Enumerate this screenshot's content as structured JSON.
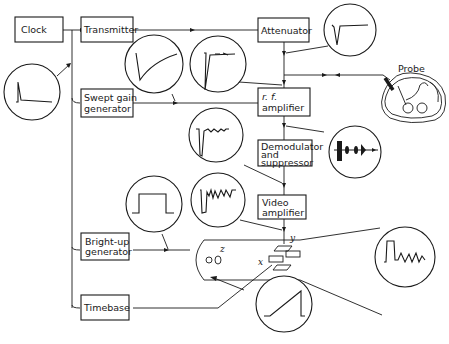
{
  "diagram": {
    "blocks": {
      "clock": "Clock",
      "transmitter": "Transmitter",
      "attenuator": "Attenuator",
      "swept_gain_1": "Swept gain",
      "swept_gain_2": "generator",
      "rf_amp_1": "r. f.",
      "rf_amp_2": "amplifier",
      "demod_1": "Demodulator",
      "demod_2": "and",
      "demod_3": "suppressor",
      "video_1": "Video",
      "video_2": "amplifier",
      "brightup_1": "Bright-up",
      "brightup_2": "generator",
      "timebase": "Timebase"
    },
    "labels": {
      "probe": "Probe",
      "y_plate": "y",
      "x_plate": "x",
      "z_grid": "z"
    },
    "waveforms": [
      "clock-pulse",
      "swept-gain-ramp",
      "rf-pulse-echo",
      "attenuator-pulse",
      "demodulated-echoes",
      "rf-burst-echoes",
      "video-echoes",
      "bright-up-gate",
      "crt-display-trace",
      "timebase-sawtooth"
    ]
  }
}
